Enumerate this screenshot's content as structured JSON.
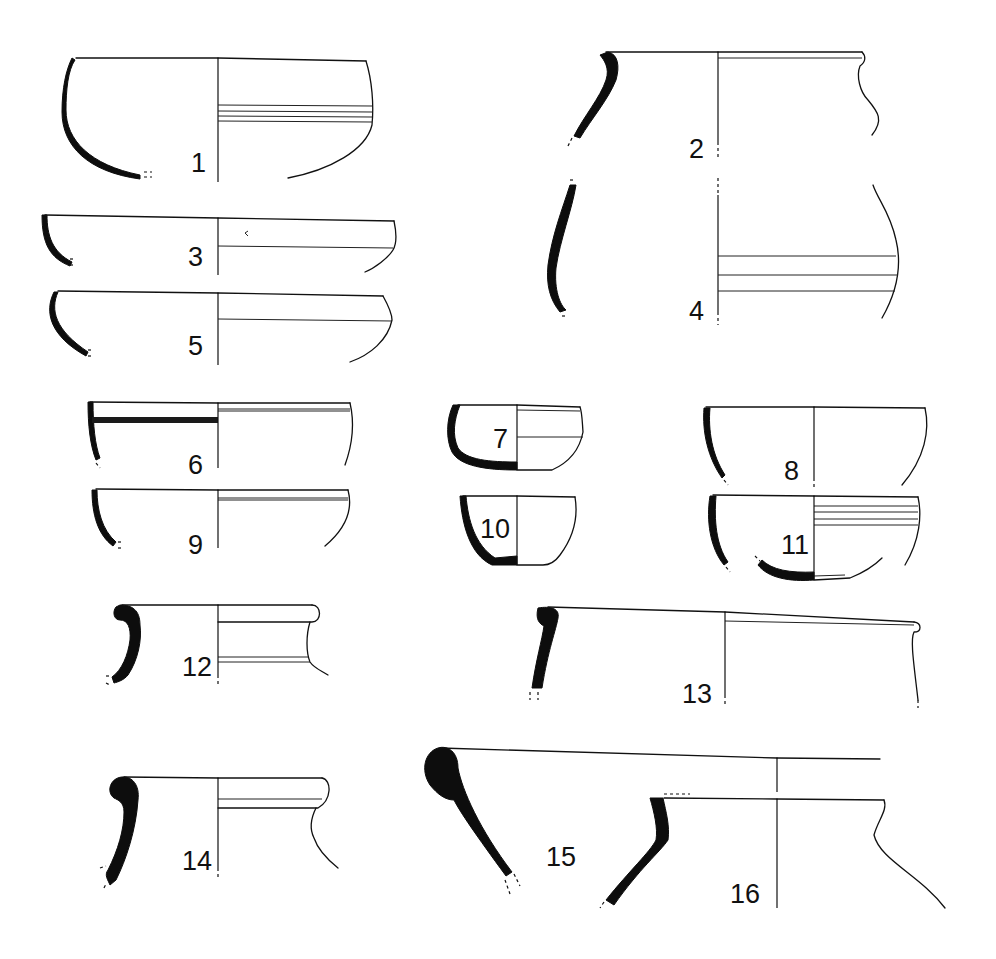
{
  "figure": {
    "type": "archaeological pottery profile drawings",
    "background": "#ffffff",
    "ink_color": "#111111",
    "vessels": [
      {
        "number": "1",
        "form": "hemispherical bowl, grooved band"
      },
      {
        "number": "2",
        "form": "jar rim with everted lip"
      },
      {
        "number": "3",
        "form": "shallow bowl"
      },
      {
        "number": "4",
        "form": "jar body with grooves"
      },
      {
        "number": "5",
        "form": "carinated bowl"
      },
      {
        "number": "6",
        "form": "bowl with painted band"
      },
      {
        "number": "7",
        "form": "small carinated cup"
      },
      {
        "number": "8",
        "form": "deep bowl"
      },
      {
        "number": "9",
        "form": "bowl with groove below rim"
      },
      {
        "number": "10",
        "form": "small cup"
      },
      {
        "number": "11",
        "form": "bowl with ribbed upper wall"
      },
      {
        "number": "12",
        "form": "jar with rolled rim"
      },
      {
        "number": "13",
        "form": "large jar rim"
      },
      {
        "number": "14",
        "form": "jar with thickened rolled rim"
      },
      {
        "number": "15",
        "form": "large thick-rimmed vessel"
      },
      {
        "number": "16",
        "form": "necked jar shoulder"
      }
    ]
  }
}
